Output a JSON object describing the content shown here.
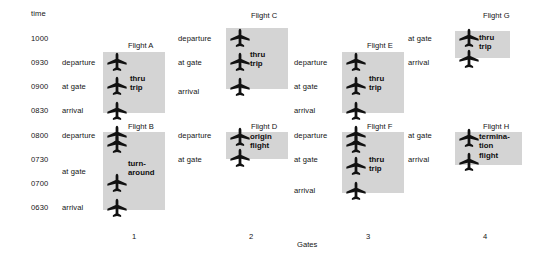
{
  "diagram": {
    "time_axis_label": "time",
    "gates_axis_label": "Gates",
    "times": [
      "1000",
      "0930",
      "0900",
      "0830",
      "0800",
      "0730",
      "0700",
      "0630"
    ],
    "gate_numbers": [
      "1",
      "2",
      "3",
      "4"
    ],
    "colors": {
      "block_fill": "#d4d4d4",
      "text": "#141414",
      "background": "#ffffff"
    },
    "icon": "airplane-icon",
    "gates": [
      {
        "number": "1",
        "events": [
          {
            "label": "departure",
            "time": "0930"
          },
          {
            "label": "at gate",
            "time": "0900"
          },
          {
            "label": "arrival",
            "time": "0830"
          },
          {
            "label": "departure",
            "time": "0800"
          },
          {
            "label": "at gate",
            "time": "0730"
          },
          {
            "label": "arrival",
            "time": "0630"
          }
        ],
        "flights": [
          {
            "name": "Flight A",
            "type": "thru\ntrip"
          },
          {
            "name": "Flight B",
            "type": "turn-\naround"
          }
        ]
      },
      {
        "number": "2",
        "events": [
          {
            "label": "departure",
            "time": "0930"
          },
          {
            "label": "at gate",
            "time": "0900"
          },
          {
            "label": "arrival",
            "time": "0830"
          },
          {
            "label": "departure",
            "time": "0800"
          },
          {
            "label": "at gate",
            "time": "0730"
          }
        ],
        "flights": [
          {
            "name": "Flight C",
            "type": "thru\ntrip"
          },
          {
            "name": "Flight D",
            "type": "origin\nflight"
          }
        ]
      },
      {
        "number": "3",
        "events": [
          {
            "label": "departure",
            "time": "0930"
          },
          {
            "label": "at gate",
            "time": "0900"
          },
          {
            "label": "arrival",
            "time": "0830"
          },
          {
            "label": "departure",
            "time": "0800"
          },
          {
            "label": "at gate",
            "time": "0730"
          },
          {
            "label": "arrival",
            "time": "0630"
          }
        ],
        "flights": [
          {
            "name": "Flight E",
            "type": "thru\ntrip"
          },
          {
            "name": "Flight F",
            "type": "thru\ntrip"
          }
        ]
      },
      {
        "number": "4",
        "events": [
          {
            "label": "at gate",
            "time": "1000"
          },
          {
            "label": "arrival",
            "time": "0930"
          },
          {
            "label": "at gate",
            "time": "0800"
          },
          {
            "label": "arrival",
            "time": "0730"
          }
        ],
        "flights": [
          {
            "name": "Flight G",
            "type": "thru\ntrip"
          },
          {
            "name": "Flight H",
            "type": "termina-\ntion\nflight"
          }
        ]
      }
    ]
  }
}
